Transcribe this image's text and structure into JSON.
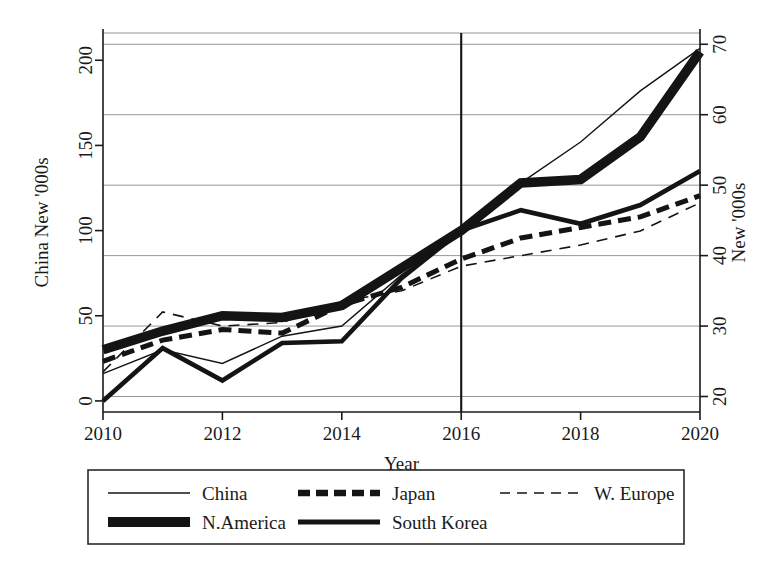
{
  "chart_data": {
    "type": "line",
    "title": "",
    "xlabel": "Year",
    "ylabel": "China New '000s",
    "ylabel_right": "New '000s",
    "x": [
      2010,
      2011,
      2012,
      2013,
      2014,
      2015,
      2016,
      2017,
      2018,
      2019,
      2020
    ],
    "xticks": [
      "2010",
      "2012",
      "2014",
      "2016",
      "2018",
      "2020"
    ],
    "xtick_values": [
      2010,
      2012,
      2014,
      2016,
      2018,
      2020
    ],
    "xlim": [
      2010,
      2020
    ],
    "yticks_left": [
      "0",
      "50",
      "100",
      "150",
      "200"
    ],
    "ytick_values_left": [
      0,
      50,
      100,
      150,
      200
    ],
    "ylim_left": [
      -6.5,
      216
    ],
    "yticks_right": [
      "20",
      "30",
      "40",
      "50",
      "60",
      "70"
    ],
    "ytick_values_right": [
      20,
      30,
      40,
      50,
      60,
      70
    ],
    "ylim_right": [
      17.8,
      71.6
    ],
    "grid": true,
    "grid_axis": "y",
    "legend_position": "below",
    "annotations": [
      {
        "type": "vline",
        "x": 2016,
        "label": ""
      }
    ],
    "series": [
      {
        "name": "China",
        "axis": "left",
        "style": "solid",
        "width": 1.4,
        "color": "#141414",
        "values": [
          16,
          30,
          22,
          38,
          44,
          74,
          98,
          128,
          152,
          182,
          207
        ]
      },
      {
        "name": "Japan",
        "axis": "right",
        "style": "dashed-thick",
        "width": 5.0,
        "color": "#141414",
        "values": [
          25.0,
          28.0,
          29.5,
          29.0,
          33.0,
          35.5,
          39.5,
          42.5,
          44.0,
          45.5,
          48.5
        ]
      },
      {
        "name": "W. Europe",
        "axis": "right",
        "style": "dashed-thin",
        "width": 1.6,
        "color": "#141414",
        "values": [
          23.5,
          32.0,
          30.0,
          30.5,
          33.5,
          35.0,
          38.5,
          40.0,
          41.5,
          43.5,
          47.5
        ]
      },
      {
        "name": "N.America",
        "axis": "left",
        "style": "solid",
        "width": 9.5,
        "color": "#141414",
        "values": [
          30,
          41,
          50,
          49,
          56,
          78,
          100,
          128,
          130,
          155,
          205
        ]
      },
      {
        "name": "South Korea",
        "axis": "left",
        "style": "solid",
        "width": 4.6,
        "color": "#141414",
        "values": [
          0,
          31,
          12,
          34,
          35,
          72,
          100,
          112,
          104,
          115,
          135
        ]
      }
    ]
  },
  "legend": {
    "entries": [
      {
        "label": "China",
        "style": "thin-solid"
      },
      {
        "label": "Japan",
        "style": "thick-dashed"
      },
      {
        "label": "W. Europe",
        "style": "thin-dashed"
      },
      {
        "label": "N.America",
        "style": "extra-thick-solid"
      },
      {
        "label": "South Korea",
        "style": "medium-solid"
      }
    ]
  },
  "colors": {
    "line": "#141414",
    "grid": "#8a8a8a",
    "axis": "#1a1a1a",
    "background": "#ffffff"
  }
}
